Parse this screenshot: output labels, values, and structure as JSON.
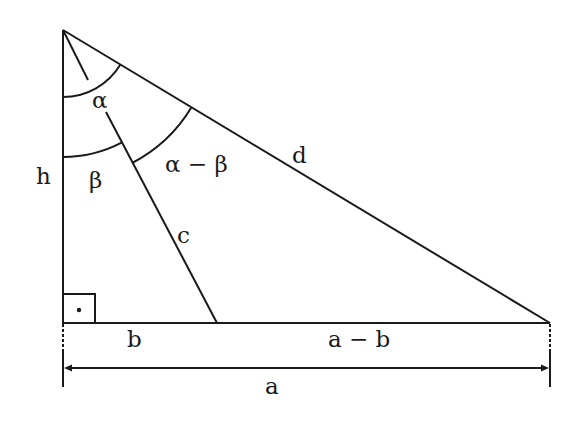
{
  "diagram": {
    "type": "right-triangle-geometry",
    "colors": {
      "line": "#1a1a1a",
      "background": "#ffffff"
    },
    "labels": {
      "h": "h",
      "alpha": "α",
      "beta": "β",
      "alpha_minus_beta": "α − β",
      "c": "c",
      "d": "d",
      "b": "b",
      "a_minus_b": "a − b",
      "a": "a"
    },
    "right_angle_marker": "right-angle-square-with-dot",
    "dimension": {
      "label": "a",
      "arrows": "both-ends"
    }
  }
}
